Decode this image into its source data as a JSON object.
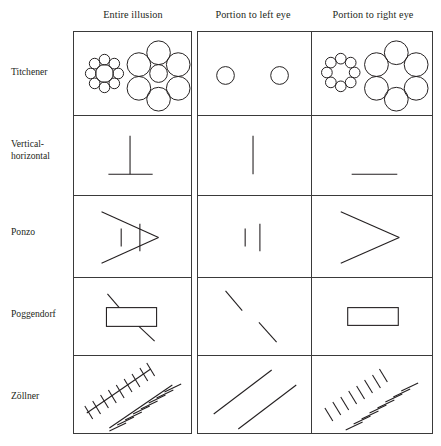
{
  "figure": {
    "type": "diagram"
  },
  "columns": [
    {
      "id": "entire",
      "label": "Entire illusion"
    },
    {
      "id": "left-eye",
      "label": "Portion to left eye"
    },
    {
      "id": "right-eye",
      "label": "Portion to right eye"
    }
  ],
  "rows": [
    {
      "id": "titchener",
      "label": "Titchener"
    },
    {
      "id": "vertical-horizontal",
      "label": "Vertical-\nhorizontal",
      "line1": "Vertical-",
      "line2": "horizontal"
    },
    {
      "id": "ponzo",
      "label": "Ponzo"
    },
    {
      "id": "poggendorf",
      "label": "Poggendorf"
    },
    {
      "id": "zollner",
      "label": "Zöllner"
    }
  ],
  "colors": {
    "ink": "#231f20",
    "rule": "#3a3a3a",
    "background": "#ffffff"
  }
}
